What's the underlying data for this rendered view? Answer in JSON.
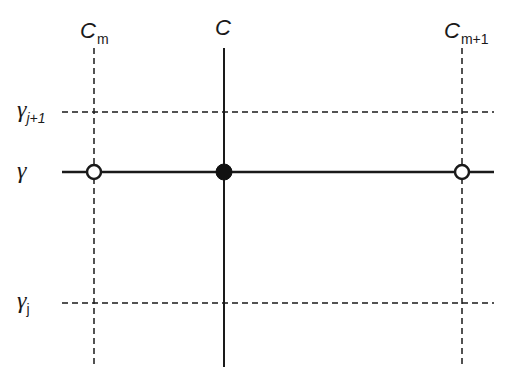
{
  "diagram": {
    "type": "grid-interpolation-diagram",
    "column_labels": [
      {
        "id": "cm",
        "base": "C",
        "sub": "m",
        "x": 94
      },
      {
        "id": "c",
        "base": "C",
        "sub": "",
        "x": 224
      },
      {
        "id": "cm1",
        "base": "C",
        "sub": "m+1",
        "x": 462
      }
    ],
    "row_labels": [
      {
        "id": "gj1",
        "base": "γ",
        "sub": "j+1",
        "y": 112
      },
      {
        "id": "g",
        "base": "γ",
        "sub": "",
        "y": 172
      },
      {
        "id": "gj",
        "base": "γ",
        "sub": "j",
        "y": 303
      }
    ],
    "points": [
      {
        "id": "cm-g",
        "style": "open",
        "x": 94,
        "y": 172
      },
      {
        "id": "c-g",
        "style": "filled",
        "x": 224,
        "y": 172
      },
      {
        "id": "cm1-g",
        "style": "open",
        "x": 462,
        "y": 172
      }
    ],
    "colors": {
      "line": "#1a1a1a",
      "background": "#ffffff"
    }
  }
}
